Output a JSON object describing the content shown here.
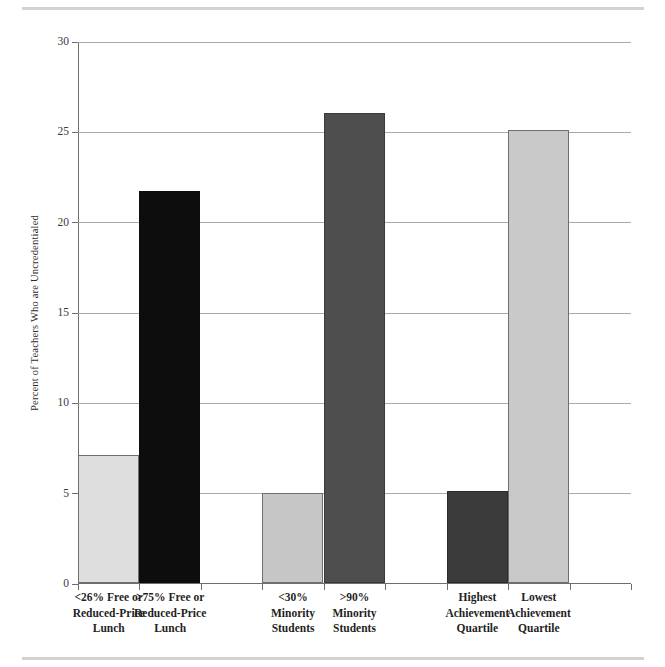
{
  "chart_data": {
    "type": "bar",
    "title": "",
    "xlabel": "",
    "ylabel": "Percent of Teachers Who are Uncredentialed",
    "ylim": [
      0,
      30
    ],
    "yticks": [
      0,
      5,
      10,
      15,
      20,
      25,
      30
    ],
    "ytick_labels": [
      "0",
      "5",
      "10",
      "15",
      "20",
      "25",
      "30"
    ],
    "grid": true,
    "legend": "none",
    "categories": [
      "<26% Free or Reduced-Price Lunch",
      ">75% Free or Reduced-Price Lunch",
      "<30% Minority Students",
      ">90% Minority Students",
      "Highest Achievement Quartile",
      "Lowest Achievement Quartile"
    ],
    "category_lines": [
      [
        "<26% Free or",
        "Reduced-Price",
        "Lunch"
      ],
      [
        ">75% Free or",
        "Reduced-Price",
        "Lunch"
      ],
      [
        "<30%",
        "Minority",
        "Students"
      ],
      [
        ">90%",
        "Minority",
        "Students"
      ],
      [
        "Highest",
        "Achievement",
        "Quartile"
      ],
      [
        "Lowest",
        "Achievement",
        "Quartile"
      ]
    ],
    "values": [
      7.1,
      21.7,
      5.0,
      26.0,
      5.1,
      25.1
    ],
    "bar_colors": [
      "#dedede",
      "#0d0d0d",
      "#c6c6c6",
      "#4e4e4e",
      "#3b3b3b",
      "#c9c9c9"
    ],
    "bar_border_colors": [
      "#6f6f6f",
      "#0d0d0d",
      "#6f6f6f",
      "#3a3a3a",
      "#2a2a2a",
      "#6f6f6f"
    ],
    "slots": [
      1,
      2,
      4,
      5,
      7,
      8
    ],
    "slot_count": 9
  },
  "colors": {
    "axis": "#6e6e6e",
    "gridline": "#a9a9a9",
    "rule": "#d2d2d2",
    "background": "#ffffff",
    "text": "#1f1f1f"
  }
}
